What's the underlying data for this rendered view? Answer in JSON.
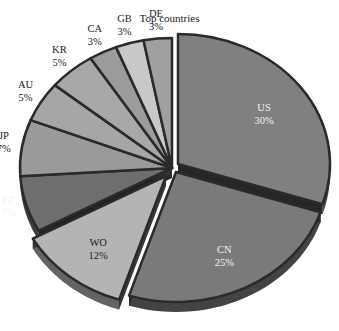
{
  "chart_data": {
    "type": "pie",
    "title": "Top countries",
    "style": "3d-exploded",
    "categories": [
      "US",
      "CN",
      "WO",
      "EP",
      "JP",
      "AU",
      "KR",
      "CA",
      "GB",
      "DE"
    ],
    "values": [
      30,
      25,
      12,
      7,
      7,
      5,
      5,
      3,
      3,
      3
    ],
    "unit": "%",
    "labels": [
      {
        "name": "US",
        "pct": "30%"
      },
      {
        "name": "CN",
        "pct": "25%"
      },
      {
        "name": "WO",
        "pct": "12%"
      },
      {
        "name": "EP",
        "pct": "7%"
      },
      {
        "name": "JP",
        "pct": "7%"
      },
      {
        "name": "AU",
        "pct": "5%"
      },
      {
        "name": "KR",
        "pct": "5%"
      },
      {
        "name": "CA",
        "pct": "3%"
      },
      {
        "name": "GB",
        "pct": "3%"
      },
      {
        "name": "DE",
        "pct": "3%"
      }
    ],
    "colors": [
      "#808080",
      "#7a7a7a",
      "#b4b4b4",
      "#6e6e6e",
      "#9a9a9a",
      "#a6a6a6",
      "#a8a8a8",
      "#9c9c9c",
      "#c8c8c8",
      "#a0a0a0"
    ],
    "legend": "none",
    "start_angle_deg": 0,
    "direction": "clockwise"
  }
}
